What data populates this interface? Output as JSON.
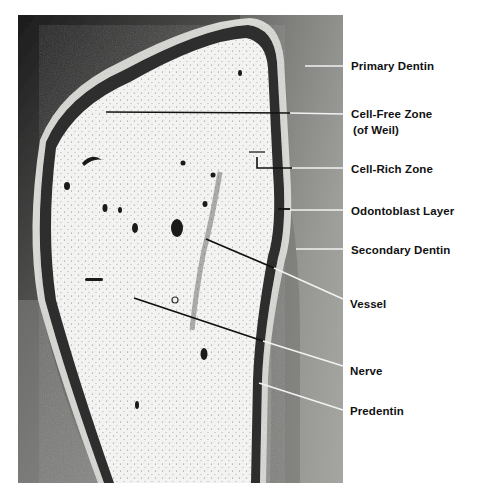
{
  "figure": {
    "colors": {
      "background": "#ffffff",
      "label_text": "#111111",
      "leader_dark": "#111111",
      "leader_light": "#f2f2f2",
      "pulp": "#f1f1ef",
      "dentin_dark": "#3a3a3a",
      "dentin_mid": "#8a8a88",
      "dentin_light": "#a9a9a6"
    },
    "labels": [
      {
        "id": "primary-dentin",
        "text": "Primary Dentin"
      },
      {
        "id": "cell-free-zone",
        "text": "Cell-Free Zone"
      },
      {
        "id": "cell-free-zone-sub",
        "text": "(of Weil)"
      },
      {
        "id": "cell-rich-zone",
        "text": "Cell-Rich Zone"
      },
      {
        "id": "odontoblast-layer",
        "text": "Odontoblast Layer"
      },
      {
        "id": "secondary-dentin",
        "text": "Secondary Dentin"
      },
      {
        "id": "vessel",
        "text": "Vessel"
      },
      {
        "id": "nerve",
        "text": "Nerve"
      },
      {
        "id": "predentin",
        "text": "Predentin"
      }
    ]
  }
}
